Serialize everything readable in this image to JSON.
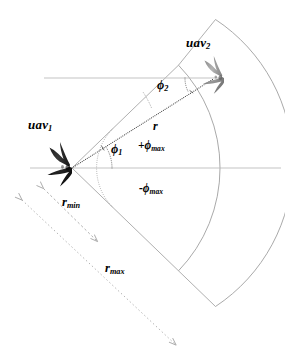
{
  "figure": {
    "background_color": "#ffffff",
    "colors": {
      "uav1_body": "#1a1a1a",
      "uav2_body": "#8c8c8c",
      "sector_line": "#9a9a9a",
      "axis_line": "#b3b3b3",
      "ray_line": "#4a4a4a",
      "dim_arrow": "#a8a8a8",
      "text": "#000000"
    }
  },
  "labels": {
    "uav1": {
      "text": "uav",
      "subscript": "1"
    },
    "uav2": {
      "text": "uav",
      "subscript": "2"
    },
    "phi1": {
      "text": "ϕ",
      "subscript": "1"
    },
    "phi2": {
      "text": "ϕ",
      "subscript": "2"
    },
    "range": {
      "text": "r"
    },
    "r_min": {
      "text": "r",
      "subscript": "min"
    },
    "r_max": {
      "text": "r",
      "subscript": "max"
    },
    "phi_max_pos": {
      "prefix": "+",
      "text": "ϕ",
      "subscript": "max"
    },
    "phi_max_neg": {
      "prefix": "-",
      "text": "ϕ",
      "subscript": "max"
    }
  },
  "geometry": {
    "apex": {
      "x": 72,
      "y": 168
    },
    "uav2_position": {
      "x": 218,
      "y": 78
    },
    "r_min_radius": 56,
    "r_max_radius": 148,
    "sector_half_angle_deg": 44,
    "phi1_deg": 32,
    "phi2_deg": 27,
    "horizontal_axis_y": 168,
    "upper_reference_line_y": 78
  }
}
